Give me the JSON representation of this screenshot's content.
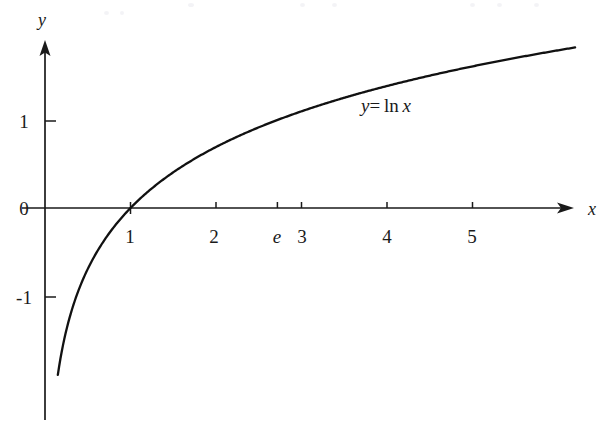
{
  "figure": {
    "background_color": "#ffffff",
    "ink_color": "#1a1a1a",
    "curve_color": "#111111"
  },
  "axes": {
    "x_axis_name": "x",
    "y_axis_name": "y",
    "origin_label": "0"
  },
  "chart_data": {
    "type": "line",
    "title": "",
    "subtitle": "",
    "xlabel": "x",
    "ylabel": "y",
    "function": "y = ln x",
    "legend": [
      "y = ln x"
    ],
    "legend_position": "inline-right-of-curve",
    "grid": false,
    "xlim": [
      -0.35,
      6.65
    ],
    "ylim": [
      -2.4,
      1.9
    ],
    "x_ticks": [
      {
        "value": 1,
        "label": "1",
        "italic": false
      },
      {
        "value": 2,
        "label": "2",
        "italic": false
      },
      {
        "value": 2.718,
        "label": "e",
        "italic": true
      },
      {
        "value": 3,
        "label": "3",
        "italic": false
      },
      {
        "value": 4,
        "label": "4",
        "italic": false
      },
      {
        "value": 5,
        "label": "5",
        "italic": false
      }
    ],
    "y_ticks": [
      {
        "value": 1,
        "label": "1"
      },
      {
        "value": 0,
        "label": "0"
      },
      {
        "value": -1,
        "label": "-1"
      }
    ],
    "annotations": [
      {
        "text": "y= ln x",
        "x": 4.0,
        "y": 1.25
      }
    ],
    "series": [
      {
        "name": "y = ln x",
        "x": [
          0.15,
          0.18,
          0.22,
          0.27,
          0.33,
          0.4,
          0.5,
          0.6,
          0.7,
          0.8,
          0.9,
          1.0,
          1.2,
          1.4,
          1.6,
          1.8,
          2.0,
          2.25,
          2.5,
          2.718,
          3.0,
          3.5,
          4.0,
          4.5,
          5.0,
          5.5,
          6.0,
          6.2
        ],
        "y": [
          -1.897,
          -1.715,
          -1.514,
          -1.309,
          -1.109,
          -0.916,
          -0.693,
          -0.511,
          -0.357,
          -0.223,
          -0.105,
          0.0,
          0.182,
          0.336,
          0.47,
          0.588,
          0.693,
          0.811,
          0.916,
          1.0,
          1.099,
          1.253,
          1.386,
          1.504,
          1.609,
          1.705,
          1.792,
          1.825
        ]
      }
    ]
  }
}
